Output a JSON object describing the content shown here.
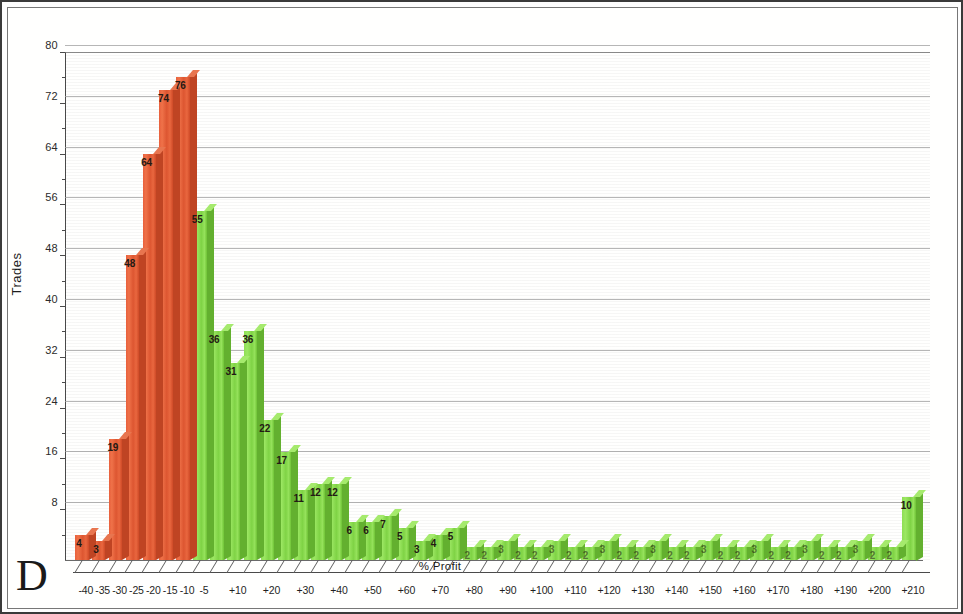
{
  "chart_data": {
    "type": "bar",
    "title": "",
    "xlabel": "% Profit",
    "ylabel": "Trades",
    "ylim": [
      0,
      80
    ],
    "y_major_ticks": [
      8,
      16,
      24,
      32,
      40,
      48,
      56,
      64,
      72,
      80
    ],
    "grid": "horizontal",
    "legend": "none",
    "x_tick_labels": [
      "-40",
      "-35",
      "-30",
      "-25",
      "-20",
      "-15",
      "-10",
      "-5",
      "+10",
      "+20",
      "+30",
      "+40",
      "+50",
      "+60",
      "+70",
      "+80",
      "+90",
      "+100",
      "+110",
      "+120",
      "+130",
      "+140",
      "+150",
      "+160",
      "+170",
      "+180",
      "+190",
      "+200",
      "+210"
    ],
    "categories": [
      "-40",
      "-35",
      "-30",
      "-25",
      "-20",
      "-15",
      "-10",
      "-5",
      "+5",
      "+10",
      "+15",
      "+20",
      "+25",
      "+30",
      "+35",
      "+40",
      "+45",
      "+50",
      "+55",
      "+60",
      "+65",
      "+70",
      "+75",
      "+80",
      "+85",
      "+90",
      "+95",
      "+100",
      "+105",
      "+110",
      "+115",
      "+120",
      "+125",
      "+130",
      "+135",
      "+140",
      "+145",
      "+150",
      "+155",
      "+160",
      "+165",
      "+170",
      "+175",
      "+180",
      "+185",
      "+190",
      "+195",
      "+200",
      "+205",
      "+210"
    ],
    "values": [
      4,
      3,
      19,
      48,
      64,
      74,
      76,
      55,
      36,
      31,
      36,
      22,
      17,
      11,
      12,
      12,
      6,
      6,
      7,
      5,
      3,
      4,
      5,
      2,
      2,
      3,
      2,
      2,
      3,
      2,
      2,
      3,
      2,
      2,
      3,
      2,
      2,
      3,
      2,
      2,
      3,
      2,
      2,
      3,
      2,
      2,
      3,
      2,
      2,
      10
    ],
    "bar_colors": [
      "loss",
      "loss",
      "loss",
      "loss",
      "loss",
      "loss",
      "loss",
      "profit",
      "profit",
      "profit",
      "profit",
      "profit",
      "profit",
      "profit",
      "profit",
      "profit",
      "profit",
      "profit",
      "profit",
      "profit",
      "profit",
      "profit",
      "profit",
      "profit",
      "profit",
      "profit",
      "profit",
      "profit",
      "profit",
      "profit",
      "profit",
      "profit",
      "profit",
      "profit",
      "profit",
      "profit",
      "profit",
      "profit",
      "profit",
      "profit",
      "profit",
      "profit",
      "profit",
      "profit",
      "profit",
      "profit",
      "profit",
      "profit",
      "profit",
      "profit"
    ],
    "data_labels": [
      "4",
      "3",
      "19",
      "48",
      "64",
      "74",
      "76",
      "55",
      "36",
      "31",
      "36",
      "22",
      "17",
      "11",
      "12",
      "12",
      "6",
      "6",
      "7",
      "5",
      "3",
      "4",
      "5",
      "2",
      "2",
      "3",
      "2",
      "2",
      "3",
      "2",
      "2",
      "3",
      "2",
      "2",
      "3",
      "2",
      "2",
      "3",
      "2",
      "2",
      "3",
      "2",
      "2",
      "3",
      "2",
      "2",
      "3",
      "2",
      "2",
      "10"
    ],
    "colors": {
      "loss": "#e8603c",
      "profit": "#8ede55",
      "axis": "#4a4a4a",
      "grid": "#9e9e9e",
      "text": "#1f1f1f"
    }
  },
  "watermark": {
    "text": "D"
  },
  "axes": {
    "y_title": "Trades",
    "x_title": "% Profit"
  }
}
